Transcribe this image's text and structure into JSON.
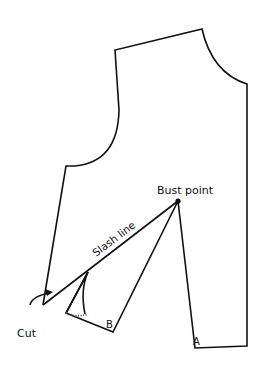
{
  "diagram": {
    "labels": {
      "bust_point": "Bust point",
      "slash_line": "Slash line",
      "cut": "Cut",
      "point_a": "A",
      "point_b": "B"
    },
    "colors": {
      "line": "#111111",
      "background": "#ffffff"
    }
  }
}
